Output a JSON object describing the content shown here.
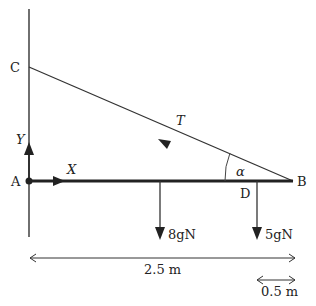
{
  "diagram": {
    "points": {
      "C": "C",
      "A": "A",
      "B": "B",
      "D": "D"
    },
    "forces": {
      "tension": "T",
      "reaction_vertical": "Y",
      "reaction_horizontal": "X",
      "weight_rod": "8gN",
      "weight_load": "5gN"
    },
    "angle": "α",
    "dimensions": {
      "total_length": "2.5 m",
      "db_length": "0.5 m"
    }
  }
}
